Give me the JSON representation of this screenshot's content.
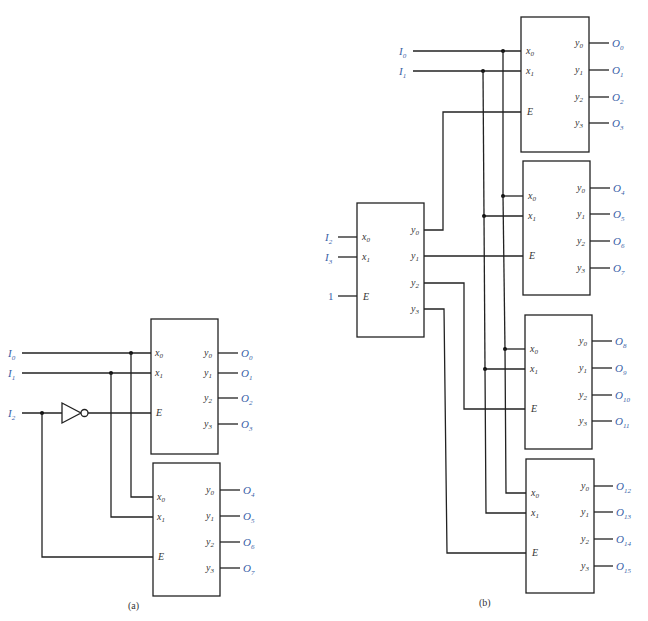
{
  "figure": {
    "caption_a": "(a)",
    "caption_b": "(b)",
    "colors": {
      "wire": "#222222",
      "signal_label": "#3a62a8",
      "pin_label": "#333333"
    }
  },
  "part_a": {
    "inputs": [
      {
        "name": "I",
        "sub": "0"
      },
      {
        "name": "I",
        "sub": "1"
      },
      {
        "name": "I",
        "sub": "2"
      }
    ],
    "inverter": "not-gate",
    "decoders": [
      {
        "pins_in": [
          {
            "n": "x",
            "s": "0"
          },
          {
            "n": "x",
            "s": "1"
          },
          {
            "n": "E",
            "s": ""
          }
        ],
        "pins_out": [
          {
            "n": "y",
            "s": "0"
          },
          {
            "n": "y",
            "s": "1"
          },
          {
            "n": "y",
            "s": "2"
          },
          {
            "n": "y",
            "s": "3"
          }
        ],
        "outputs": [
          {
            "n": "O",
            "s": "0"
          },
          {
            "n": "O",
            "s": "1"
          },
          {
            "n": "O",
            "s": "2"
          },
          {
            "n": "O",
            "s": "3"
          }
        ]
      },
      {
        "pins_in": [
          {
            "n": "x",
            "s": "0"
          },
          {
            "n": "x",
            "s": "1"
          },
          {
            "n": "E",
            "s": ""
          }
        ],
        "pins_out": [
          {
            "n": "y",
            "s": "0"
          },
          {
            "n": "y",
            "s": "1"
          },
          {
            "n": "y",
            "s": "2"
          },
          {
            "n": "y",
            "s": "3"
          }
        ],
        "outputs": [
          {
            "n": "O",
            "s": "4"
          },
          {
            "n": "O",
            "s": "5"
          },
          {
            "n": "O",
            "s": "6"
          },
          {
            "n": "O",
            "s": "7"
          }
        ]
      }
    ]
  },
  "part_b": {
    "inputs": [
      {
        "name": "I",
        "sub": "0"
      },
      {
        "name": "I",
        "sub": "1"
      },
      {
        "name": "I",
        "sub": "2"
      },
      {
        "name": "I",
        "sub": "3"
      },
      {
        "name": "1",
        "sub": ""
      }
    ],
    "decoders": [
      {
        "outputs": [
          {
            "n": "O",
            "s": "0"
          },
          {
            "n": "O",
            "s": "1"
          },
          {
            "n": "O",
            "s": "2"
          },
          {
            "n": "O",
            "s": "3"
          }
        ]
      },
      {
        "outputs": [
          {
            "n": "O",
            "s": "4"
          },
          {
            "n": "O",
            "s": "5"
          },
          {
            "n": "O",
            "s": "6"
          },
          {
            "n": "O",
            "s": "7"
          }
        ]
      },
      {
        "outputs": [
          {
            "n": "O",
            "s": "8"
          },
          {
            "n": "O",
            "s": "9"
          },
          {
            "n": "O",
            "s": "10"
          },
          {
            "n": "O",
            "s": "11"
          }
        ]
      },
      {
        "outputs": [
          {
            "n": "O",
            "s": "12"
          },
          {
            "n": "O",
            "s": "13"
          },
          {
            "n": "O",
            "s": "14"
          },
          {
            "n": "O",
            "s": "15"
          }
        ]
      }
    ]
  }
}
